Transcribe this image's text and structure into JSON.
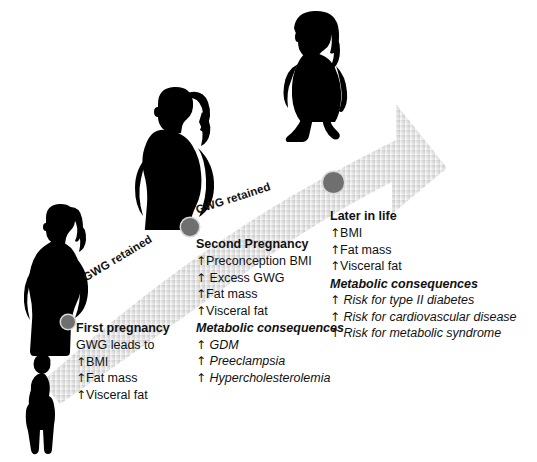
{
  "figure": {
    "background_color": "#ffffff",
    "arrow": {
      "color_start": "#f2f2f2",
      "color_end": "#c9c9c9",
      "node_color": "#6f6f6f",
      "labels": [
        {
          "name": "gwg-retained-left",
          "text": "GWG retained"
        },
        {
          "name": "gwg-retained-right",
          "text": "GWG retained"
        }
      ]
    },
    "silhouettes": [
      {
        "name": "pre-pregnancy-woman",
        "description": "slim standing woman"
      },
      {
        "name": "first-pregnancy-woman",
        "description": "pregnant woman with ponytail"
      },
      {
        "name": "second-pregnancy-woman",
        "description": "larger pregnant woman, hand on hip"
      },
      {
        "name": "later-in-life-woman",
        "description": "obese walking woman"
      }
    ]
  },
  "stages": [
    {
      "id": "first-pregnancy",
      "title": "First pregnancy",
      "lead": "GWG leads to",
      "items": [
        {
          "arrow": "↑",
          "text": "BMI"
        },
        {
          "arrow": "↑",
          "text": "Fat mass"
        },
        {
          "arrow": "↑",
          "text": "Visceral fat"
        }
      ],
      "consequences_title": "",
      "consequences": []
    },
    {
      "id": "second-pregnancy",
      "title": "Second Pregnancy",
      "lead": "",
      "items": [
        {
          "arrow": "↑",
          "text": "Preconception BMI"
        },
        {
          "arrow": "↑",
          "text": "Excess GWG"
        },
        {
          "arrow": "↑",
          "text": "Fat mass"
        },
        {
          "arrow": "↑",
          "text": "Visceral fat"
        }
      ],
      "consequences_title": "Metabolic consequences",
      "consequences": [
        {
          "arrow": "↑",
          "text": "GDM"
        },
        {
          "arrow": "↑",
          "text": "Preeclampsia"
        },
        {
          "arrow": "↑",
          "text": "Hypercholesterolemia"
        }
      ]
    },
    {
      "id": "later-in-life",
      "title": "Later in life",
      "lead": "",
      "items": [
        {
          "arrow": "↑",
          "text": "BMI"
        },
        {
          "arrow": "↑",
          "text": "Fat mass"
        },
        {
          "arrow": "↑",
          "text": "Visceral fat"
        }
      ],
      "consequences_title": "Metabolic consequences",
      "consequences": [
        {
          "arrow": "↑",
          "text": "Risk for type II diabetes"
        },
        {
          "arrow": "↑",
          "text": "Risk for cardiovascular disease"
        },
        {
          "arrow": "↑",
          "text": "Risk for metabolic syndrome"
        }
      ]
    }
  ]
}
